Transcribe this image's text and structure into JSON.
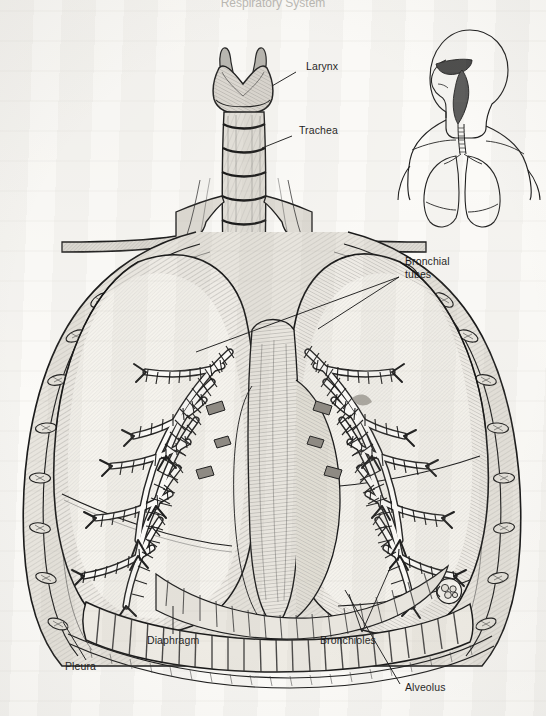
{
  "figure": {
    "title": "Respiratory System",
    "style": "engraving / cross-hatched line drawing on scanned book page",
    "background_color": "#fbfaf7",
    "ink_color": "#252525"
  },
  "labels": [
    {
      "id": "larynx",
      "text": "Larynx",
      "x": 306,
      "y": 66,
      "align": "left"
    },
    {
      "id": "trachea",
      "text": "Trachea",
      "x": 299,
      "y": 130,
      "align": "left"
    },
    {
      "id": "bronchial-tubes",
      "text": "Bronchial\ntubes",
      "x": 405,
      "y": 261,
      "align": "left"
    },
    {
      "id": "diaphragm",
      "text": "Diaphragm",
      "x": 147,
      "y": 640,
      "align": "left"
    },
    {
      "id": "bronchioles",
      "text": "Bronchioles",
      "x": 320,
      "y": 640,
      "align": "left"
    },
    {
      "id": "pleura",
      "text": "Pleura",
      "x": 65,
      "y": 666,
      "align": "left"
    },
    {
      "id": "alveolus",
      "text": "Alveolus",
      "x": 405,
      "y": 687,
      "align": "left"
    }
  ],
  "leader_lines": [
    {
      "for": "larynx",
      "points": "296,72 272,86"
    },
    {
      "for": "trachea",
      "points": "292,136 262,148"
    },
    {
      "for": "bronchial-tubes",
      "points": "399,277 318,329"
    },
    {
      "for": "bronchial-tubes2",
      "points": "399,277 196,352"
    },
    {
      "for": "diaphragm",
      "points": "173,634 173,606"
    },
    {
      "for": "bronchioles",
      "points": "362,632 349,594"
    },
    {
      "for": "bronchioles2",
      "points": "362,632 391,566"
    },
    {
      "for": "pleura",
      "points": "86,660 63,622"
    },
    {
      "for": "alveolus",
      "points": "400,684 345,590"
    }
  ],
  "structures": [
    {
      "name": "larynx",
      "description": "thyroid cartilage, V-shaped notch with two superior horns"
    },
    {
      "name": "trachea",
      "description": "windpipe, stacked C-shaped cartilage rings"
    },
    {
      "name": "clavicle-left",
      "description": "collar bone extending to left shoulder"
    },
    {
      "name": "clavicle-right",
      "description": "collar bone extending to right shoulder"
    },
    {
      "name": "left-lung",
      "description": "lung cut open exposing bronchial tree"
    },
    {
      "name": "right-lung",
      "description": "lung cut open exposing bronchial tree"
    },
    {
      "name": "bronchial-tree",
      "description": "segmented branching airways dividing into bronchioles"
    },
    {
      "name": "mediastinum",
      "description": "central region containing heart and great vessels"
    },
    {
      "name": "diaphragm",
      "description": "dome-shaped muscle with radiating fibres below lungs"
    },
    {
      "name": "pleura",
      "description": "membrane lining the chest wall and lung surface"
    },
    {
      "name": "ribs",
      "description": "rib cross-sections along the chest wall"
    },
    {
      "name": "alveolus-detail",
      "description": "small circular magnified alveolar sac cluster"
    }
  ],
  "inset": {
    "name": "orientation-figure",
    "description": "head and upper torso in profile showing nasal cavity, pharynx, trachea and lungs in place",
    "x": 412,
    "y": 20,
    "width": 126,
    "height": 176
  }
}
